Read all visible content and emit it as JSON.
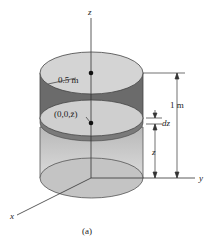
{
  "figure": {
    "caption": "(a)",
    "axes": {
      "z": "z",
      "y": "y",
      "x": "x"
    },
    "labels": {
      "radius": "0.5 m",
      "point": "(0,0,z̄)",
      "height": "1 m",
      "dz": "dz",
      "z_dim": "z"
    },
    "colors": {
      "top_face": "#d4d4d4",
      "dark_band": "#6b6b6b",
      "disk": "#c8c8c8",
      "lower_body": "#bdbdbd",
      "line": "#333333"
    }
  }
}
